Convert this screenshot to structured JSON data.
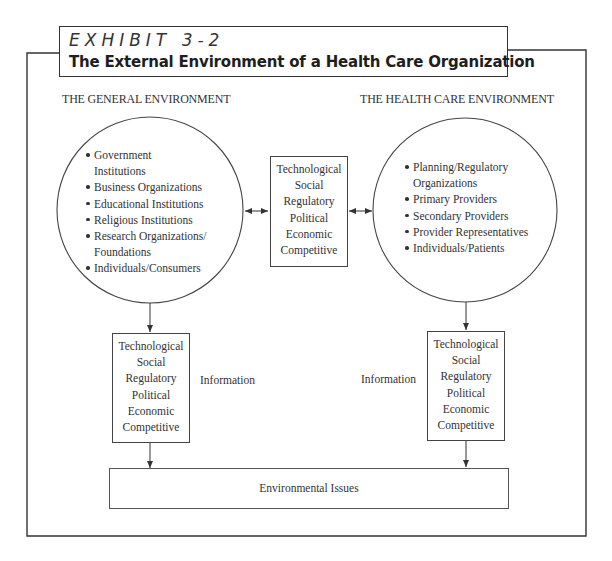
{
  "exhibit": {
    "label": "EXHIBIT 3-2",
    "title": "The External Environment of a Health Care Organization"
  },
  "general_environment": {
    "heading": "THE GENERAL ENVIRONMENT",
    "items": [
      {
        "line1": "Government",
        "line2": "Institutions"
      },
      {
        "line1": "Business Organizations"
      },
      {
        "line1": "Educational Institutions"
      },
      {
        "line1": "Religious Institutions"
      },
      {
        "line1": "Research Organizations/",
        "line2": "Foundations"
      },
      {
        "line1": "Individuals/Consumers"
      }
    ]
  },
  "health_care_environment": {
    "heading": "THE HEALTH CARE ENVIRONMENT",
    "items": [
      {
        "line1": "Planning/Regulatory",
        "line2": "Organizations"
      },
      {
        "line1": "Primary Providers"
      },
      {
        "line1": "Secondary Providers"
      },
      {
        "line1": "Provider Representatives"
      },
      {
        "line1": "Individuals/Patients"
      }
    ]
  },
  "factors": {
    "center": [
      "Technological",
      "Social",
      "Regulatory",
      "Political",
      "Economic",
      "Competitive"
    ],
    "left": [
      "Technological",
      "Social",
      "Regulatory",
      "Political",
      "Economic",
      "Competitive"
    ],
    "right": [
      "Technological",
      "Social",
      "Regulatory",
      "Political",
      "Economic",
      "Competitive"
    ]
  },
  "info_labels": {
    "left": "Information",
    "right": "Information"
  },
  "issues": {
    "label": "Environmental Issues"
  },
  "colors": {
    "line": "#333333",
    "text": "#2a2a2a",
    "background": "#ffffff"
  }
}
